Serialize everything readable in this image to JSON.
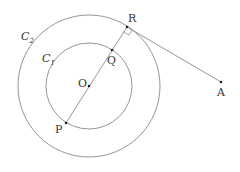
{
  "figure": {
    "type": "geometry",
    "labels": {
      "outer_circle": "C",
      "outer_circle_sub": "2",
      "inner_circle": "C",
      "inner_circle_sub": "1",
      "center": "O",
      "point_p": "P",
      "point_q": "Q",
      "point_r": "R",
      "point_a": "A"
    },
    "colors": {
      "line": "#888888",
      "point": "#222222",
      "text": "#333333"
    }
  }
}
